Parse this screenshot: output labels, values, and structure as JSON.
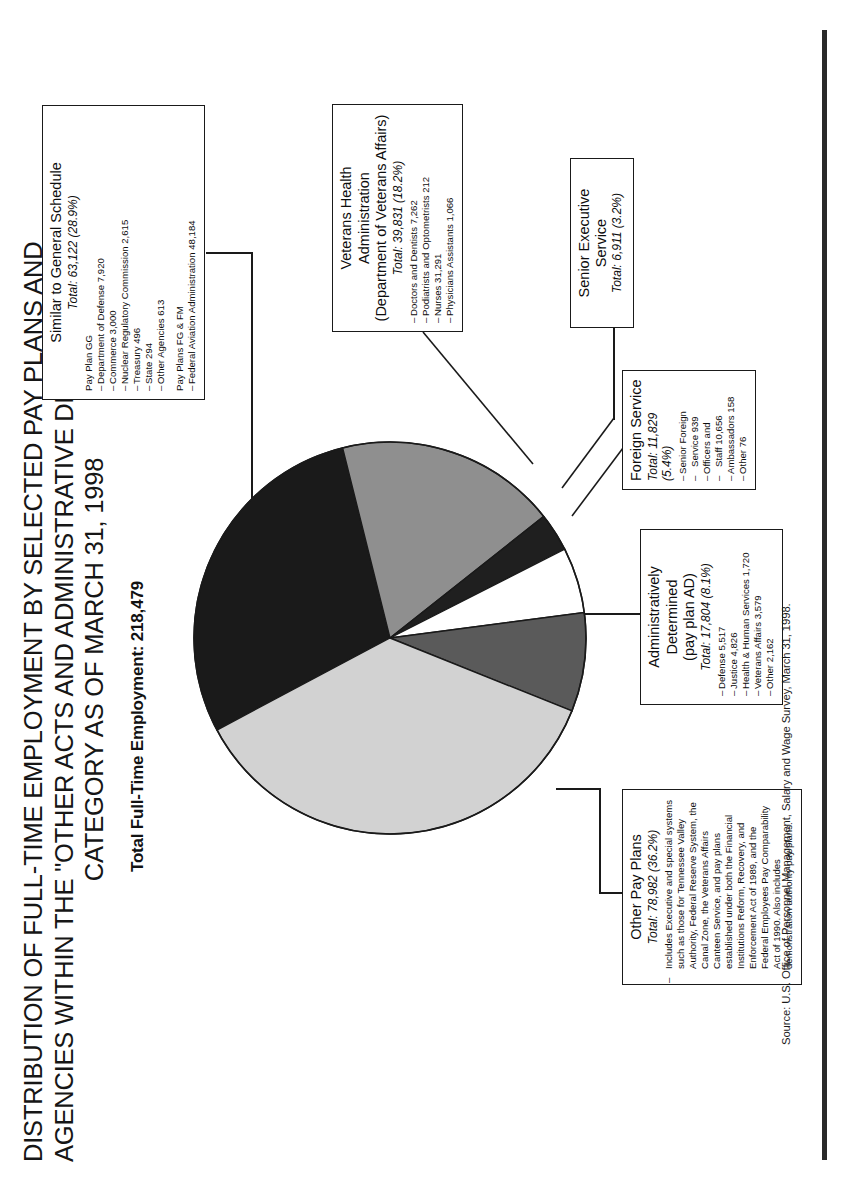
{
  "title": {
    "line1": "DISTRIBUTION OF FULL-TIME EMPLOYMENT BY SELECTED PAY PLANS AND",
    "line2": "AGENCIES WITHIN THE \"OTHER ACTS AND ADMINISTRATIVE DETERMINATION\"",
    "line3": "CATEGORY AS OF MARCH 31, 1998"
  },
  "subtitle": "Total Full-Time Employment:  218,479",
  "source": "Source: U.S. Office of Personnel Management, Salary and Wage Survey, March 31, 1998.",
  "colors": {
    "similar_to_gs": "#1a1a1a",
    "veterans_health": "#8f8f8f",
    "senior_executive": "#1f1f1f",
    "foreign_service": "#ffffff",
    "administratively_determined": "#5a5a5a",
    "other_pay_plans": "#d2d2d2",
    "outline": "#1a1a1a"
  },
  "boxes": {
    "similar_to_gs": {
      "title": "Similar to General Schedule",
      "total": "Total: 63,122 (28.9%)",
      "group1_label": "Pay Plan GG",
      "group1_items": [
        "Department of Defense  7,920",
        "Commerce 3,000",
        "Nuclear Regulatory Commission 2,615",
        "Treasury  496",
        "State  294",
        "Other Agencies  613"
      ],
      "group2_label": "Pay Plans FG & FM",
      "group2_items": [
        "Federal Aviation Administration 48,184"
      ]
    },
    "veterans_health": {
      "title_line1": "Veterans Health",
      "title_line2": "Administration",
      "title_line3": "(Department of Veterans Affairs)",
      "total": "Total: 39,831 (18.2%)",
      "items": [
        "Doctors and Dentists  7,262",
        "Podiatrists and Optometrists  212",
        "Nurses 31,291",
        "Physicians Assistants  1,066"
      ]
    },
    "senior_executive": {
      "title": "Senior Executive Service",
      "total": "Total: 6,911 (3.2%)"
    },
    "foreign_service": {
      "title": "Foreign Service",
      "total": "Total: 11,829 (5.4%)",
      "items": [
        "Senior Foreign",
        "Service  939",
        "Officers and",
        "Staff  10,656",
        "Ambassadors  158",
        "Other  76"
      ]
    },
    "administratively_determined": {
      "title_line1": "Administratively",
      "title_line2": "Determined",
      "title_line3": "(pay plan AD)",
      "total": "Total: 17,804 (8.1%)",
      "items": [
        "Defense  5,517",
        "Justice  4,826",
        "Health & Human Services  1,720",
        "Veterans Affairs  3,579",
        "Other  2,162"
      ]
    },
    "other_pay_plans": {
      "title": "Other  Pay  Plans",
      "total": "Total: 78,982 (36.2%)",
      "note": "Includes Executive and special systems such as those for Tennessee Valley Authority, Federal Reserve System, the Canal Zone, the Veterans Affairs Canteen Service, and pay plans established under both the Financial Institutions Reform, Recovery, and Enforcement Act of 1989, and the Federal Employees Pay Comparability Act of 1990.  Also includes demonstration authority pay plans."
    }
  },
  "chart_data": {
    "type": "pie",
    "title": "Distribution of Full-Time Employment by Selected Pay Plans and Agencies Within the \"Other Acts and Administrative Determination\" Category as of March 31, 1998",
    "total": 218479,
    "total_label": "Total Full-Time Employment:  218,479",
    "legend_position": "callout-boxes",
    "labels": [
      "Similar to General Schedule",
      "Veterans Health Administration (Department of Veterans Affairs)",
      "Senior Executive Service",
      "Foreign Service",
      "Administratively Determined (pay plan AD)",
      "Other Pay Plans"
    ],
    "values": [
      63122,
      39831,
      6911,
      11829,
      17804,
      78982
    ],
    "percents": [
      28.9,
      18.2,
      3.2,
      5.4,
      8.1,
      36.2
    ],
    "slice_colors": [
      "#1a1a1a",
      "#8f8f8f",
      "#1f1f1f",
      "#ffffff",
      "#5a5a5a",
      "#d2d2d2"
    ],
    "start_angle_deg": 0,
    "direction": "clockwise"
  }
}
